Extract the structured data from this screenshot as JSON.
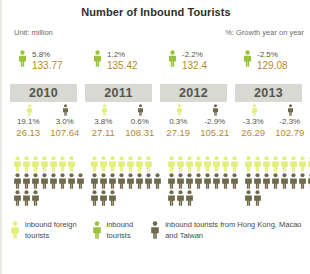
{
  "header": {
    "title": "Number of Inbound Tourists",
    "unit_label": "Unit: million",
    "growth_label": "%: Growth year on year"
  },
  "colors": {
    "pale_green": "#e2ef7a",
    "green": "#9cc13c",
    "brown": "#6f6a4d",
    "value_text": "#b8892f",
    "pct_text": "#55554c",
    "year_band_bg": "#d9d9d4",
    "year_band_text": "#55554c"
  },
  "legend": {
    "items": [
      {
        "icon": "person-icon",
        "color_key": "pale_green",
        "label": "inbound foreign tourists"
      },
      {
        "icon": "person-icon",
        "color_key": "green",
        "label": "inbound tourists"
      },
      {
        "icon": "person-icon",
        "color_key": "brown",
        "label": "inbound tourists from Hong Kong, Macao and Taiwan"
      }
    ]
  },
  "chart_data": {
    "type": "bar",
    "title": "Number of Inbound Tourists",
    "subtitle": "Unit: million; %: Growth year on year",
    "xlabel": "",
    "ylabel": "million",
    "categories": [
      "2010",
      "2011",
      "2012",
      "2013"
    ],
    "series": [
      {
        "name": "inbound tourists",
        "color": "#9cc13c",
        "values": [
          133.77,
          135.42,
          132.4,
          129.08
        ],
        "growth": [
          "5.8%",
          "1.2%",
          "-2.2%",
          "-2.5%"
        ],
        "value_labels": [
          "133.77",
          "135.42",
          "132.4",
          "129.08"
        ]
      },
      {
        "name": "inbound foreign tourists",
        "color": "#e2ef7a",
        "values": [
          26.13,
          27.11,
          27.19,
          26.29
        ],
        "growth": [
          "19.1%",
          "3.8%",
          "0.3%",
          "-3.3%"
        ],
        "value_labels": [
          "26.13",
          "27.11",
          "27.19",
          "26.29"
        ],
        "pictogram_counts": [
          7,
          7,
          8,
          8
        ]
      },
      {
        "name": "inbound tourists from Hong Kong, Macao and Taiwan",
        "color": "#6f6a4d",
        "values": [
          107.64,
          108.31,
          105.21,
          102.79
        ],
        "growth": [
          "3.0%",
          "0.6%",
          "-2.9%",
          "-2.3%"
        ],
        "value_labels": [
          "107.64",
          "108.31",
          "105.21",
          "102.79"
        ],
        "pictogram_counts": [
          11,
          11,
          11,
          10
        ]
      }
    ],
    "grid": false,
    "legend_position": "bottom"
  },
  "columns": [
    {
      "year": "2010",
      "total": {
        "pct": "5.8%",
        "value": "133.77",
        "icon": "person-icon"
      },
      "foreign": {
        "pct": "19.1%",
        "value": "26.13",
        "icon": "person-icon"
      },
      "hkmt": {
        "pct": "3.0%",
        "value": "107.64",
        "icon": "person-icon"
      },
      "pictogram": {
        "green_row": 7,
        "brown_row_1": 8,
        "brown_row_2": 3
      }
    },
    {
      "year": "2011",
      "total": {
        "pct": "1.2%",
        "value": "135.42",
        "icon": "person-icon"
      },
      "foreign": {
        "pct": "3.8%",
        "value": "27.11",
        "icon": "person-icon"
      },
      "hkmt": {
        "pct": "0.6%",
        "value": "108.31",
        "icon": "person-icon"
      },
      "pictogram": {
        "green_row": 7,
        "brown_row_1": 8,
        "brown_row_2": 3
      }
    },
    {
      "year": "2012",
      "total": {
        "pct": "-2.2%",
        "value": "132.4",
        "icon": "person-icon"
      },
      "foreign": {
        "pct": "0.3%",
        "value": "27.19",
        "icon": "person-icon"
      },
      "hkmt": {
        "pct": "-2.9%",
        "value": "105.21",
        "icon": "person-icon"
      },
      "pictogram": {
        "green_row": 8,
        "brown_row_1": 8,
        "brown_row_2": 3
      }
    },
    {
      "year": "2013",
      "total": {
        "pct": "-2.5%",
        "value": "129.08",
        "icon": "person-icon"
      },
      "foreign": {
        "pct": "-3.3%",
        "value": "26.29",
        "icon": "person-icon"
      },
      "hkmt": {
        "pct": "-2.3%",
        "value": "102.79",
        "icon": "person-icon"
      },
      "pictogram": {
        "green_row": 8,
        "brown_row_1": 8,
        "brown_row_2": 2
      }
    }
  ]
}
